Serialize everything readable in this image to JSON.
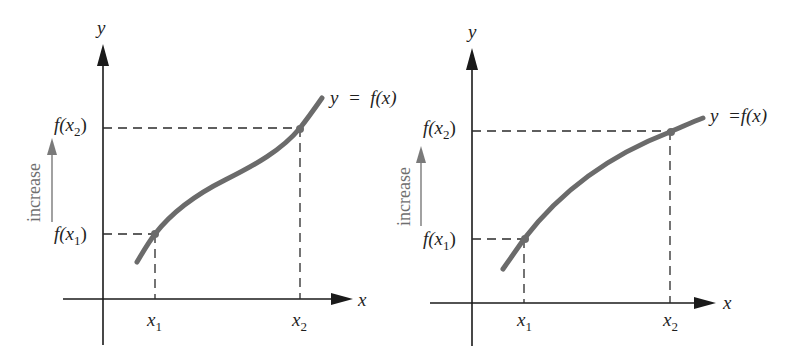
{
  "figure": {
    "colors": {
      "axis": "#1a1a1a",
      "curve": "#6b6b6b",
      "guide_lines": "#2a2a2a",
      "increase_label": "#6e6e6e"
    }
  },
  "left_graph": {
    "y_axis_label": "y",
    "x_axis_label": "x",
    "curve_label": "y  =  f(x)",
    "curve_shape": "S-shaped (concave down then concave up)",
    "x_ticks": [
      {
        "base": "x",
        "sub": "1"
      },
      {
        "base": "x",
        "sub": "2"
      }
    ],
    "y_ticks": [
      {
        "prefix": "f(",
        "base": "x",
        "sub": "2",
        "suffix": ")"
      },
      {
        "prefix": "f(",
        "base": "x",
        "sub": "1",
        "suffix": ")"
      }
    ],
    "increase_label": "increase"
  },
  "right_graph": {
    "y_axis_label": "y",
    "x_axis_label": "x",
    "curve_label": "y  =f(x)",
    "curve_shape": "concave down",
    "x_ticks": [
      {
        "base": "x",
        "sub": "1"
      },
      {
        "base": "x",
        "sub": "2"
      }
    ],
    "y_ticks": [
      {
        "prefix": "f(",
        "base": "x",
        "sub": "2",
        "suffix": ")"
      },
      {
        "prefix": "f(",
        "base": "x",
        "sub": "1",
        "suffix": ")"
      }
    ],
    "increase_label": "increase"
  }
}
